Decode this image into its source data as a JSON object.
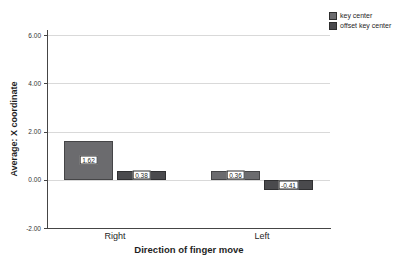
{
  "chart_data": {
    "type": "bar",
    "title": "",
    "xlabel": "Direction of finger move",
    "ylabel": "Average: X coordinate",
    "categories": [
      "Right",
      "Left"
    ],
    "series": [
      {
        "name": "key center",
        "color": "#6b6b6e",
        "values": [
          1.62,
          0.36
        ]
      },
      {
        "name": "offset key center",
        "color": "#4a4a4d",
        "values": [
          0.38,
          -0.41
        ]
      }
    ],
    "value_labels": [
      [
        "1.62",
        "0.36"
      ],
      [
        "0.38",
        "-0.41"
      ]
    ],
    "y_ticks": [
      {
        "value": 6,
        "label": "6.00"
      },
      {
        "value": 4,
        "label": "4.00"
      },
      {
        "value": 2,
        "label": "2.00"
      },
      {
        "value": 0,
        "label": "0.00"
      },
      {
        "value": -2,
        "label": "-2.00"
      }
    ],
    "ylim": [
      -2,
      6
    ],
    "grid": true,
    "legend_position": "top-right",
    "bar_value_labels_shown": true
  }
}
